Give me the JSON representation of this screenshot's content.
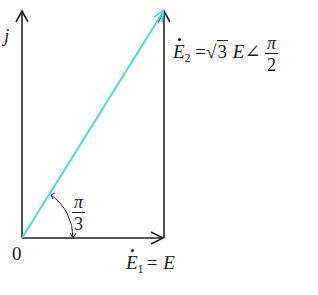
{
  "diagram": {
    "type": "phasor-diagram",
    "axes": {
      "imaginary_label": "j",
      "origin_label": "0"
    },
    "vectors": [
      {
        "name": "E1",
        "symbol": "E",
        "subscript": "1",
        "equals": "= E",
        "direction": "horizontal",
        "color": "#222222"
      },
      {
        "name": "E2",
        "symbol": "E",
        "subscript": "2",
        "equals": "=",
        "magnitude_root": "3",
        "magnitude_tail": "E",
        "angle_symbol": "∠",
        "angle_num": "π",
        "angle_den": "2",
        "color": "#222222"
      },
      {
        "name": "resultant",
        "direction": "diagonal",
        "color": "#5cd3dd"
      }
    ],
    "angle_annotation": {
      "num": "π",
      "den": "3"
    }
  },
  "colors": {
    "axis": "#222222",
    "resultant": "#5cd3dd",
    "background": "#ffffff"
  }
}
